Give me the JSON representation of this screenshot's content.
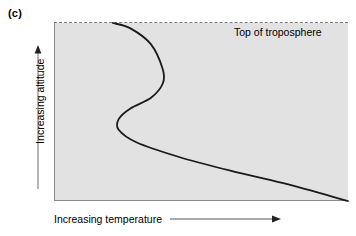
{
  "figure": {
    "panel_label": "(c)",
    "axes": {
      "y_label": "Increasing altitude",
      "x_label": "Increasing temperature"
    },
    "annotations": {
      "troposphere_top": "Top of troposphere"
    },
    "colors": {
      "panel_background": "#e2e2e2",
      "axis_line": "#8a8a8a",
      "curve": "#1a1a1a",
      "dashed_line": "#7d7d7d",
      "page_background": "#ffffff"
    }
  },
  "chart_data": {
    "type": "line",
    "title": "",
    "subtitle": "",
    "xlabel": "Increasing temperature",
    "ylabel": "Increasing altitude",
    "xlim": [
      0,
      1
    ],
    "ylim": [
      0,
      1
    ],
    "grid": false,
    "legend": null,
    "axis_ticks": {
      "x": [],
      "y": []
    },
    "annotations": [
      {
        "text": "Top of troposphere",
        "type": "dashed-horizontal-line-label",
        "y": 1.0
      },
      {
        "text": "(c)",
        "type": "panel-label"
      }
    ],
    "series": [
      {
        "name": "Temperature profile",
        "description": "Temperature decreases with altitude through most of the troposphere, with an inversion layer producing an S-shaped kink near the upper portion of the profile",
        "x": [
          0.2,
          0.26,
          0.33,
          0.37,
          0.37,
          0.33,
          0.26,
          0.22,
          0.22,
          0.28,
          0.42,
          0.6,
          0.78,
          1.0
        ],
        "y": [
          1.0,
          0.97,
          0.88,
          0.74,
          0.66,
          0.58,
          0.52,
          0.46,
          0.4,
          0.33,
          0.25,
          0.17,
          0.1,
          0.0
        ]
      }
    ]
  }
}
